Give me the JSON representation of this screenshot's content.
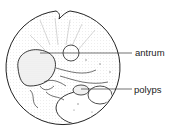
{
  "figure": {
    "type": "endoscopic view illustration",
    "labels": [
      {
        "text": "antrum",
        "x": 135,
        "y": 48
      },
      {
        "text": "polyps",
        "x": 134,
        "y": 85
      }
    ]
  },
  "colors": {
    "line": "#222222",
    "stipple": "#9a9a9a",
    "background": "#ffffff"
  }
}
